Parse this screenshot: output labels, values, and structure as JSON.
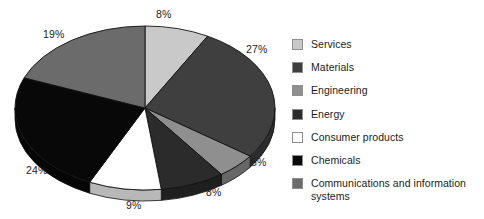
{
  "chart_data": {
    "type": "pie",
    "title": "",
    "subtitle": "",
    "xlabel": "",
    "ylabel": "",
    "grid": false,
    "legend_position": "right",
    "style": "3d-ellipse",
    "total": 100,
    "units": "%",
    "categories": [
      "Services",
      "Materials",
      "Engineering",
      "Energy",
      "Consumer products",
      "Chemicals",
      "Communications and information systems"
    ],
    "values": [
      8,
      27,
      5,
      8,
      9,
      24,
      19
    ],
    "labels": [
      "8%",
      "27%",
      "5%",
      "8%",
      "9%",
      "24%",
      "19%"
    ],
    "colors": [
      "#c9c9c9",
      "#3f3f3f",
      "#8f8f8f",
      "#2b2b2b",
      "#ffffff",
      "#080808",
      "#6b6b6b"
    ],
    "slices": [
      {
        "label": "Services",
        "value": 8,
        "display": "8%",
        "color": "#c9c9c9",
        "start_deg": 0,
        "end_deg": 28.8
      },
      {
        "label": "Materials",
        "value": 27,
        "display": "27%",
        "color": "#3f3f3f",
        "start_deg": 28.8,
        "end_deg": 126.0
      },
      {
        "label": "Engineering",
        "value": 5,
        "display": "5%",
        "color": "#8f8f8f",
        "start_deg": 126.0,
        "end_deg": 144.0
      },
      {
        "label": "Energy",
        "value": 8,
        "display": "8%",
        "color": "#2b2b2b",
        "start_deg": 144.0,
        "end_deg": 172.8
      },
      {
        "label": "Consumer products",
        "value": 9,
        "display": "9%",
        "color": "#ffffff",
        "start_deg": 172.8,
        "end_deg": 205.2
      },
      {
        "label": "Chemicals",
        "value": 24,
        "display": "24%",
        "color": "#080808",
        "start_deg": 205.2,
        "end_deg": 291.6
      },
      {
        "label": "Communications and information systems",
        "value": 19,
        "display": "19%",
        "color": "#6b6b6b",
        "start_deg": 291.6,
        "end_deg": 360.0
      }
    ]
  },
  "pie": {
    "labels": {
      "top": "8%",
      "right": "27%",
      "lower_right": "5%",
      "bottom_right": "8%",
      "bottom": "9%",
      "bottom_left": "24%",
      "upper_left": "19%"
    }
  },
  "legend": {
    "items": [
      {
        "label": "Services",
        "color": "#c9c9c9",
        "swatch": "legend-swatch-services"
      },
      {
        "label": "Materials",
        "color": "#3f3f3f",
        "swatch": "legend-swatch-materials"
      },
      {
        "label": "Engineering",
        "color": "#8f8f8f",
        "swatch": "legend-swatch-engineering"
      },
      {
        "label": "Energy",
        "color": "#2b2b2b",
        "swatch": "legend-swatch-energy"
      },
      {
        "label": "Consumer products",
        "color": "#ffffff",
        "swatch": "legend-swatch-consumer-products"
      },
      {
        "label": "Chemicals",
        "color": "#080808",
        "swatch": "legend-swatch-chemicals"
      },
      {
        "label": "Communications and information\nsystems",
        "color": "#6b6b6b",
        "swatch": "legend-swatch-communications"
      }
    ]
  }
}
